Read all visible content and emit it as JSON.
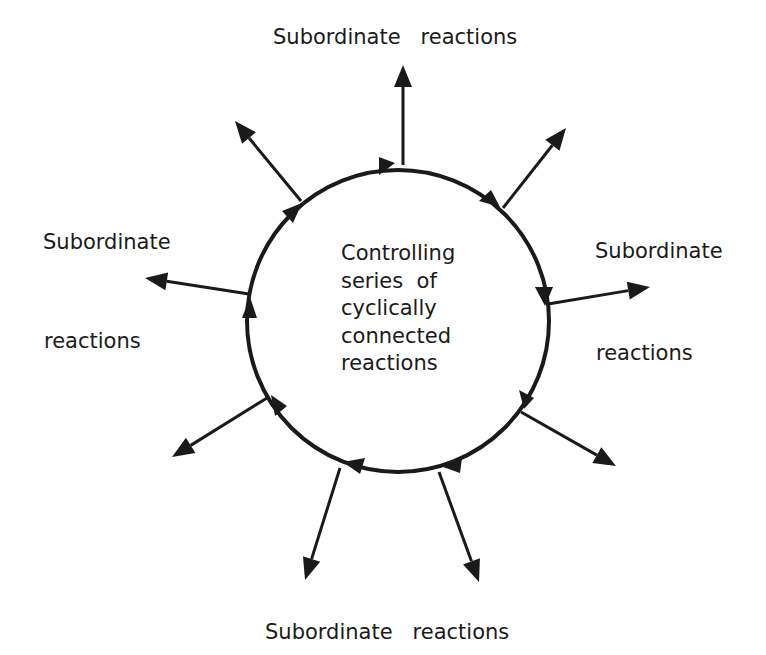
{
  "diagram": {
    "center_label": {
      "lines": [
        "Controlling",
        "series  of",
        "cyclically",
        "connected",
        "reactions"
      ]
    },
    "labels": {
      "top": "Subordinate   reactions",
      "left_1": "Subordinate",
      "left_2": "reactions",
      "right_1": "Subordinate",
      "right_2": "reactions",
      "bottom": "Subordinate   reactions"
    },
    "cycle": {
      "center": [
        398,
        321
      ],
      "radius": 151,
      "direction": "clockwise",
      "stroke_color": "#1a1a1a"
    },
    "spokes": [
      {
        "id": "top",
        "from": [
          403,
          165
        ],
        "to": [
          403,
          65
        ]
      },
      {
        "id": "upper-left",
        "from": [
          301,
          201
        ],
        "to": [
          235,
          121
        ]
      },
      {
        "id": "upper-right",
        "from": [
          503,
          208
        ],
        "to": [
          566,
          128
        ]
      },
      {
        "id": "left",
        "from": [
          249,
          294
        ],
        "to": [
          145,
          278
        ]
      },
      {
        "id": "right",
        "from": [
          548,
          304
        ],
        "to": [
          650,
          287
        ]
      },
      {
        "id": "lower-left",
        "from": [
          267,
          398
        ],
        "to": [
          172,
          457
        ]
      },
      {
        "id": "lower-right",
        "from": [
          521,
          412
        ],
        "to": [
          616,
          466
        ]
      },
      {
        "id": "bottom-left",
        "from": [
          340,
          468
        ],
        "to": [
          305,
          580
        ]
      },
      {
        "id": "bottom-right",
        "from": [
          439,
          472
        ],
        "to": [
          479,
          582
        ]
      }
    ]
  }
}
